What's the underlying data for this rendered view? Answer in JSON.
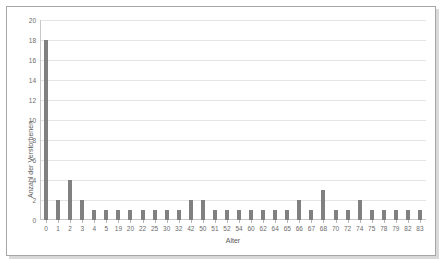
{
  "chart_data": {
    "type": "bar",
    "title": "",
    "xlabel": "Alter",
    "ylabel": "Anzahl der Verstorbenen",
    "categories": [
      "0",
      "1",
      "2",
      "3",
      "4",
      "5",
      "19",
      "20",
      "22",
      "25",
      "30",
      "32",
      "42",
      "50",
      "51",
      "52",
      "54",
      "60",
      "62",
      "64",
      "65",
      "66",
      "67",
      "68",
      "70",
      "72",
      "74",
      "75",
      "78",
      "79",
      "82",
      "83"
    ],
    "values": [
      18,
      2,
      4,
      2,
      1,
      1,
      1,
      1,
      1,
      1,
      1,
      1,
      2,
      2,
      1,
      1,
      1,
      1,
      1,
      1,
      1,
      2,
      1,
      3,
      1,
      1,
      2,
      1,
      1,
      1,
      1,
      1
    ],
    "ylim": [
      0,
      20
    ],
    "ytick_labels": [
      "0",
      "2",
      "4",
      "6",
      "8",
      "10",
      "12",
      "14",
      "16",
      "18",
      "20"
    ],
    "ytick_values": [
      0,
      2,
      4,
      6,
      8,
      10,
      12,
      14,
      16,
      18,
      20
    ],
    "grid": true,
    "legend": false,
    "legend_position": "none",
    "bar_color": "#808080",
    "grid_color": "#e4e4e4",
    "axis_color": "#c8c8c8",
    "tick_label_color": "#6b6b6b",
    "axis_title_color": "#595959",
    "plot_background": "#ffffff",
    "frame_border_color": "#a6a6a6"
  }
}
